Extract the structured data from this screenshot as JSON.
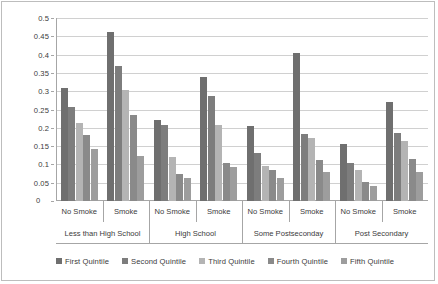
{
  "chart_data": {
    "type": "bar",
    "title": "",
    "xlabel": "",
    "ylabel": "Probability of Poor Health",
    "ylim": [
      0,
      0.5
    ],
    "ytick_values": [
      0,
      0.05,
      0.1,
      0.15,
      0.2,
      0.25,
      0.3,
      0.35,
      0.4,
      0.45,
      0.5
    ],
    "ytick_labels": [
      "0",
      "0.05",
      "0.1",
      "0.15",
      "0.2",
      "0.25",
      "0.3",
      "0.35",
      "0.4",
      "0.45",
      "0.5"
    ],
    "grid": true,
    "legend_position": "bottom",
    "categories": [
      "No Smoke",
      "Smoke",
      "No Smoke",
      "Smoke",
      "No Smoke",
      "Smoke",
      "No Smoke",
      "Smoke"
    ],
    "category_groups": [
      {
        "label": "Less than High School",
        "span": 2
      },
      {
        "label": "High School",
        "span": 2
      },
      {
        "label": "Some Postseconday",
        "span": 2
      },
      {
        "label": "Post Secondary",
        "span": 2
      }
    ],
    "series": [
      {
        "name": "First Quintile",
        "color": "#6f6f6f",
        "values": [
          0.31,
          0.462,
          0.222,
          0.34,
          0.206,
          0.404,
          0.156,
          0.271
        ]
      },
      {
        "name": "Second Quintile",
        "color": "#7d7d7d",
        "values": [
          0.257,
          0.37,
          0.208,
          0.288,
          0.131,
          0.183,
          0.104,
          0.185
        ]
      },
      {
        "name": "Third Quintile",
        "color": "#b4b4b4",
        "values": [
          0.213,
          0.302,
          0.121,
          0.209,
          0.095,
          0.173,
          0.085,
          0.163
        ]
      },
      {
        "name": "Fourth Quintile",
        "color": "#8a8a8a",
        "values": [
          0.18,
          0.234,
          0.075,
          0.104,
          0.086,
          0.113,
          0.051,
          0.115
        ]
      },
      {
        "name": "Fifth Quintile",
        "color": "#9d9d9d",
        "values": [
          0.141,
          0.122,
          0.063,
          0.094,
          0.062,
          0.08,
          0.041,
          0.08
        ]
      }
    ]
  }
}
